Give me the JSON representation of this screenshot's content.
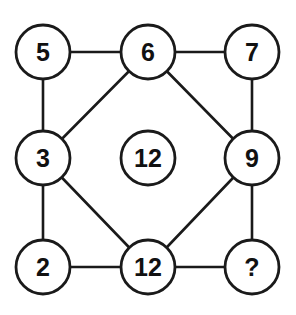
{
  "puzzle": {
    "colors": {
      "line": "#1a1a1a",
      "circle_fill": "#ffffff",
      "text": "#111111"
    },
    "nodes": {
      "top_left": "5",
      "top_middle": "6",
      "top_right": "7",
      "middle_left": "3",
      "center": "12",
      "middle_right": "9",
      "bottom_left": "2",
      "bottom_middle": "12",
      "bottom_right": "?"
    },
    "edges": [
      [
        "top_left",
        "top_middle"
      ],
      [
        "top_middle",
        "top_right"
      ],
      [
        "top_left",
        "middle_left"
      ],
      [
        "top_right",
        "middle_right"
      ],
      [
        "middle_left",
        "bottom_left"
      ],
      [
        "middle_right",
        "bottom_right"
      ],
      [
        "bottom_left",
        "bottom_middle"
      ],
      [
        "bottom_middle",
        "bottom_right"
      ],
      [
        "top_middle",
        "middle_left"
      ],
      [
        "top_middle",
        "middle_right"
      ],
      [
        "middle_left",
        "bottom_middle"
      ],
      [
        "middle_right",
        "bottom_middle"
      ]
    ]
  }
}
